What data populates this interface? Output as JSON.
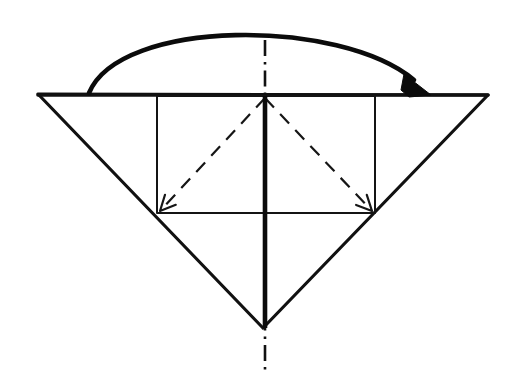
{
  "figure": {
    "kind": "line-drawing",
    "background_color": "#ffffff",
    "ink_color": "#111111",
    "canvas": {
      "width": 511,
      "height": 391
    }
  },
  "geometry": {
    "top_edge": {
      "label": "top horizontal edge",
      "x1": 38,
      "y1": 95,
      "x2": 488,
      "y2": 95
    },
    "triangle": {
      "label": "inverted triangle outline",
      "left_corner": {
        "x": 38,
        "y": 94
      },
      "right_corner": {
        "x": 488,
        "y": 95
      },
      "bottom_vertex": {
        "x": 263,
        "y": 328
      },
      "points": "38,94 488,95 263,328"
    },
    "rectangle": {
      "label": "inscribed rectangle",
      "left": 157,
      "top": 96,
      "right": 375,
      "bottom": 213,
      "points": "157,96 375,96 375,213 157,213"
    },
    "center_axis": {
      "label": "dash-dot symmetry axis",
      "x": 265,
      "y_top": 40,
      "y_bottom": 371
    },
    "crease_spine": {
      "label": "vertical center crease",
      "x": 265,
      "y_top": 96,
      "y_bottom": 328
    },
    "fold_lines": [
      {
        "name": "left-diagonal-fold",
        "from": {
          "x": 265,
          "y": 98
        },
        "to": {
          "x": 160,
          "y": 211
        },
        "style": "dashed",
        "arrowhead_at": "to"
      },
      {
        "name": "right-diagonal-fold",
        "from": {
          "x": 265,
          "y": 98
        },
        "to": {
          "x": 372,
          "y": 211
        },
        "style": "dashed",
        "arrowhead_at": "to"
      }
    ],
    "motion_arrow": {
      "name": "fold-over-arrow",
      "description": "curved arrow sweeping from left edge over the top to the right edge",
      "start": {
        "x": 89,
        "y": 93
      },
      "control_1": {
        "x": 120,
        "y": 18
      },
      "control_2": {
        "x": 340,
        "y": 18
      },
      "end": {
        "x": 414,
        "y": 80
      },
      "peak_y": 30,
      "arrowhead": {
        "tip": {
          "x": 431,
          "y": 95
        },
        "points": "431,95 404,74 401,90 409,97"
      }
    }
  },
  "annotations": {
    "line_styles": [
      {
        "name": "solid",
        "meaning": "paper edge"
      },
      {
        "name": "dashed",
        "meaning": "valley fold"
      },
      {
        "name": "dash-dot",
        "meaning": "axis of symmetry"
      },
      {
        "name": "curved-arrow",
        "meaning": "fold direction"
      }
    ]
  }
}
